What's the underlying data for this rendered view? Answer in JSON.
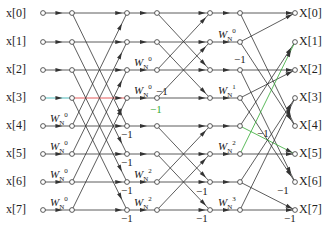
{
  "diagram": {
    "inputs": [
      "x[0]",
      "x[1]",
      "x[2]",
      "x[3]",
      "x[4]",
      "x[5]",
      "x[6]",
      "x[7]"
    ],
    "outputs": [
      "X[0]",
      "X[1]",
      "X[2]",
      "X[3]",
      "X[4]",
      "X[5]",
      "X[6]",
      "X[7]"
    ],
    "stage1_twiddles": [
      {
        "row": 4,
        "label": "W",
        "sub": "N",
        "sup": "0"
      },
      {
        "row": 5,
        "label": "W",
        "sub": "N",
        "sup": "0"
      },
      {
        "row": 6,
        "label": "W",
        "sub": "N",
        "sup": "0"
      },
      {
        "row": 7,
        "label": "W",
        "sub": "N",
        "sup": "0"
      }
    ],
    "stage2_twiddles": [
      {
        "row": 2,
        "label": "W",
        "sub": "N",
        "sup": "0"
      },
      {
        "row": 3,
        "label": "W",
        "sub": "N",
        "sup": "0"
      },
      {
        "row": 6,
        "label": "W",
        "sub": "N",
        "sup": "2"
      },
      {
        "row": 7,
        "label": "W",
        "sub": "N",
        "sup": "2"
      }
    ],
    "stage3_twiddles": [
      {
        "row": 1,
        "label": "W",
        "sub": "N",
        "sup": "0"
      },
      {
        "row": 3,
        "label": "W",
        "sub": "N",
        "sup": "1"
      },
      {
        "row": 5,
        "label": "W",
        "sub": "N",
        "sup": "2"
      },
      {
        "row": 7,
        "label": "W",
        "sub": "N",
        "sup": "3"
      }
    ],
    "minus_one": "−1",
    "colors": {
      "line": "#333333",
      "node": "#ffffff",
      "highlight_red": "#d33",
      "highlight_green": "#3a3"
    }
  }
}
